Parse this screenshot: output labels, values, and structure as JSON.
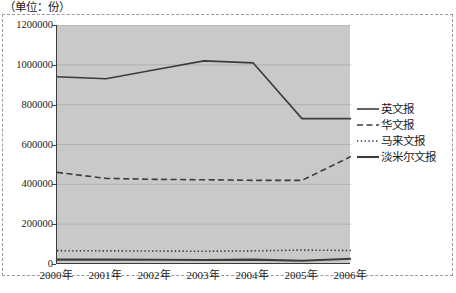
{
  "figure": {
    "unit_label": "（单位：份）"
  },
  "chart_data": {
    "type": "line",
    "title": "",
    "xlabel": "",
    "ylabel": "",
    "unit": "份",
    "unit_note": "（单位：份）",
    "categories": [
      "2000年",
      "2001年",
      "2002年",
      "2003年",
      "2004年",
      "2005年",
      "2006年"
    ],
    "ylim": [
      0,
      1200000
    ],
    "ytick_labels": [
      "1200000",
      "1000000",
      "800000",
      "600000",
      "400000",
      "200000",
      "0"
    ],
    "ytick_values": [
      1200000,
      1000000,
      800000,
      600000,
      400000,
      200000,
      0
    ],
    "ytick_step": 200000,
    "grid": "horizontal",
    "legend_position": "right",
    "plot_background": "#c9c9c9",
    "line_color": "#3c3c3c",
    "series": [
      {
        "name": "英文报",
        "style": "solid",
        "values": [
          940000,
          930000,
          975000,
          1020000,
          1010000,
          730000,
          730000
        ]
      },
      {
        "name": "华文报",
        "style": "dashed",
        "values": [
          460000,
          430000,
          425000,
          423000,
          420000,
          420000,
          540000
        ]
      },
      {
        "name": "马来文报",
        "style": "dotted",
        "values": [
          67000,
          66000,
          65000,
          64000,
          66000,
          70000,
          68000
        ]
      },
      {
        "name": "淡米尔文报",
        "style": "solid-bold",
        "values": [
          22000,
          22000,
          21000,
          20000,
          22000,
          16000,
          26000
        ]
      }
    ]
  }
}
